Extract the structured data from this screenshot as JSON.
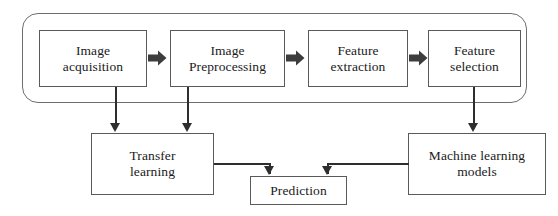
{
  "diagram": {
    "type": "flowchart",
    "pipeline_group": {
      "name": "image-processing-pipeline",
      "shape": "rounded-rectangle"
    },
    "nodes": [
      {
        "id": "image-acquisition",
        "label": "Image\nacquisition"
      },
      {
        "id": "image-preprocessing",
        "label": "Image\nPreprocessing"
      },
      {
        "id": "feature-extraction",
        "label": "Feature\nextraction"
      },
      {
        "id": "feature-selection",
        "label": "Feature\nselection"
      },
      {
        "id": "transfer-learning",
        "label": "Transfer\nlearning"
      },
      {
        "id": "prediction",
        "label": "Prediction"
      },
      {
        "id": "machine-learning-models",
        "label": "Machine learning\nmodels"
      }
    ],
    "connectors": [
      {
        "id": "acq-to-preprocessing",
        "from": "image-acquisition",
        "to": "image-preprocessing",
        "style": "block-arrow"
      },
      {
        "id": "preprocessing-to-extraction",
        "from": "image-preprocessing",
        "to": "feature-extraction",
        "style": "block-arrow"
      },
      {
        "id": "extraction-to-selection",
        "from": "feature-extraction",
        "to": "feature-selection",
        "style": "block-arrow"
      },
      {
        "id": "acq-to-transfer",
        "from": "image-acquisition",
        "to": "transfer-learning",
        "style": "line-arrow"
      },
      {
        "id": "preprocessing-to-transfer",
        "from": "image-preprocessing",
        "to": "transfer-learning",
        "style": "line-arrow"
      },
      {
        "id": "selection-to-ml-models",
        "from": "feature-selection",
        "to": "machine-learning-models",
        "style": "line-arrow"
      },
      {
        "id": "transfer-to-prediction",
        "from": "transfer-learning",
        "to": "prediction",
        "style": "line-arrow"
      },
      {
        "id": "ml-models-to-prediction",
        "from": "machine-learning-models",
        "to": "prediction",
        "style": "line-arrow"
      }
    ],
    "colors": {
      "box_border": "#5a5a5a",
      "container_border": "#6e6e6e",
      "connector": "#2e2e2e",
      "text": "#1a1a1a",
      "background": "#ffffff"
    }
  }
}
